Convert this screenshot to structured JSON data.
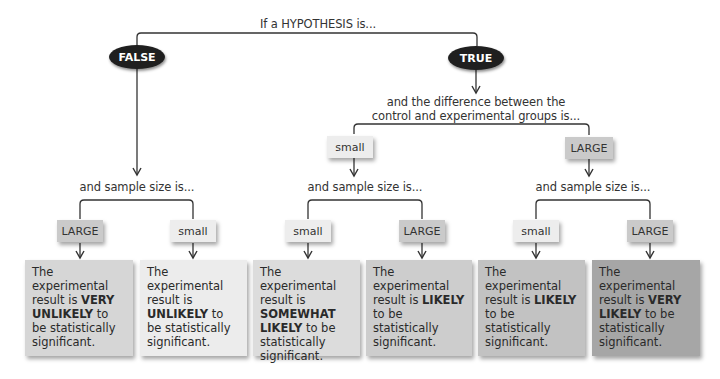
{
  "title": "If a HYPOTHESIS is...",
  "branches": {
    "false_label": "FALSE",
    "true_label": "TRUE"
  },
  "difference_prompt": {
    "line1": "and the difference between the",
    "line2": "control and experimental groups is..."
  },
  "difference_levels": {
    "small": "small",
    "large": "LARGE"
  },
  "sample_prompt": "and sample size is...",
  "sample_levels": [
    "LARGE",
    "small",
    "small",
    "LARGE",
    "small",
    "LARGE"
  ],
  "results": [
    {
      "pre": "The experimental result is ",
      "emph": "VERY UNLIKELY",
      "post": " to be statistically significant.",
      "color": "#d6d6d6"
    },
    {
      "pre": "The experimental result is ",
      "emph": "UNLIKELY",
      "post": " to be statistically significant.",
      "color": "#ececec"
    },
    {
      "pre": "The experimental result is ",
      "emph": "SOMEWHAT LIKELY",
      "post": " to be statistically significant.",
      "color": "#dcdcdc"
    },
    {
      "pre": "The experimental result is ",
      "emph": "LIKELY",
      "post": " to be statistically significant.",
      "color": "#cdcdcd"
    },
    {
      "pre": "The experimental result is ",
      "emph": "LIKELY",
      "post": " to be statistically significant.",
      "color": "#c2c2c2"
    },
    {
      "pre": "The experimental result is ",
      "emph": "VERY LIKELY",
      "post": " to be statistically significant.",
      "color": "#a6a6a6"
    }
  ],
  "colors": {
    "oval": "#1f1f1f",
    "line": "#333333",
    "small_box": "#ededed",
    "large_box": "#c9c9c9"
  }
}
